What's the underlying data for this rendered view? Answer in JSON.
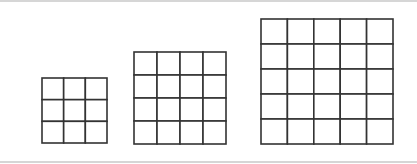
{
  "figure": {
    "background": "#ffffff",
    "rule_color": "#d6d6d6",
    "line_color": "#333333",
    "line_width": 1.6,
    "grids": [
      {
        "id": "grid-3x3",
        "rows": 3,
        "cols": 3,
        "x": 42,
        "y": 78,
        "width": 65,
        "height": 65
      },
      {
        "id": "grid-4x4",
        "rows": 4,
        "cols": 4,
        "x": 134,
        "y": 52,
        "width": 92,
        "height": 92
      },
      {
        "id": "grid-5x5",
        "rows": 5,
        "cols": 5,
        "x": 261,
        "y": 19,
        "width": 132,
        "height": 125
      }
    ]
  }
}
